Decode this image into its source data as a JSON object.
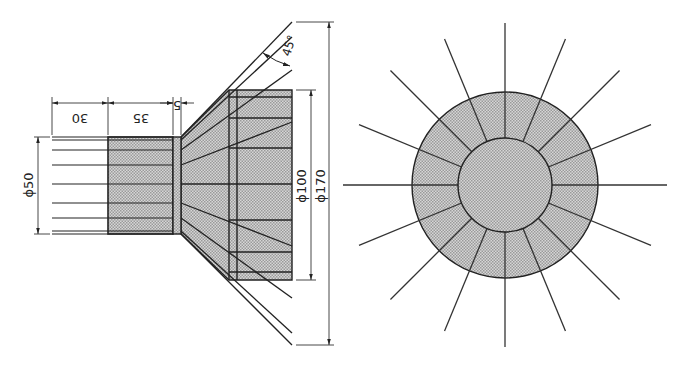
{
  "figure": {
    "side_view": {
      "dimensions": {
        "length_1": "30",
        "length_2": "35",
        "flange": "5",
        "diameter_small": "ϕ50",
        "diameter_mid": "ϕ100",
        "diameter_large": "ϕ170",
        "angle": "45°"
      }
    },
    "front_view": {
      "spoke_count": 16,
      "outer_radius_px": 93,
      "inner_radius_px": 47
    },
    "colors": {
      "line": "#222222",
      "fill": "#c8c8c8",
      "background": "#ffffff"
    }
  }
}
